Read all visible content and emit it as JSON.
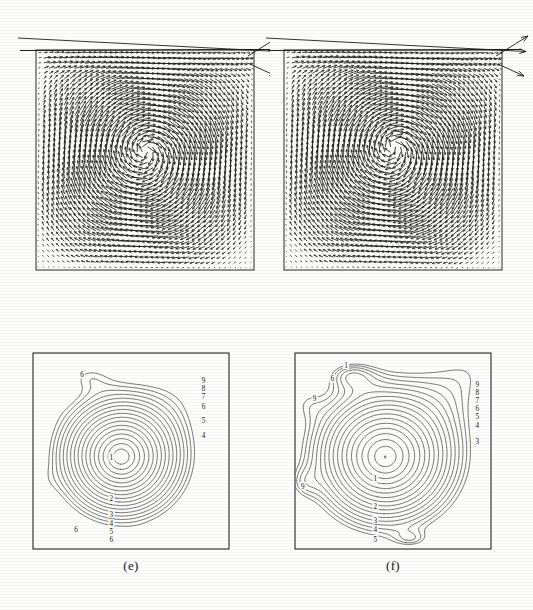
{
  "figure": {
    "type": "multi-panel scientific figure",
    "background_color": "#fdfdfc",
    "ink_color": "#1a1a1a",
    "panel_count": 4
  },
  "panels": [
    {
      "id": "vector-left",
      "kind": "vector-field",
      "caption": "",
      "box": {
        "x": 36,
        "y": 50,
        "width": 218,
        "height": 220
      },
      "description": "Velocity vector field in a square cavity; primary clockwise vortex centred slightly above mid-height; dense short vectors near all walls; long lid vectors overshoot the top-right corner.",
      "vortex_center": {
        "x": 0.49,
        "y": 0.44
      },
      "lid_arrow_count": 3
    },
    {
      "id": "vector-right",
      "kind": "vector-field",
      "caption": "",
      "box": {
        "x": 284,
        "y": 50,
        "width": 218,
        "height": 220
      },
      "description": "Velocity vector field in a square cavity; primary vortex larger and rounder than left panel; lid vectors overshoot the top-right corner.",
      "vortex_center": {
        "x": 0.47,
        "y": 0.45
      },
      "lid_arrow_count": 3
    },
    {
      "id": "contour-e",
      "kind": "contour",
      "caption": "(e)",
      "box": {
        "x": 33,
        "y": 353,
        "width": 196,
        "height": 196
      },
      "caption_pos": {
        "x": 131,
        "y": 566
      }
    },
    {
      "id": "contour-f",
      "kind": "contour",
      "caption": "(f)",
      "box": {
        "x": 295,
        "y": 353,
        "width": 196,
        "height": 196
      },
      "caption_pos": {
        "x": 393,
        "y": 566
      }
    }
  ],
  "chart_data": [
    {
      "type": "line",
      "id": "contour-e",
      "title": "(e)",
      "subtitle": "Streamfunction / temperature contours, coarse-grid solution",
      "xlabel": "",
      "ylabel": "",
      "xlim": [
        0,
        1
      ],
      "ylim": [
        0,
        1
      ],
      "grid": false,
      "legend": "none",
      "axes_frame": true,
      "contour_levels": [
        1,
        2,
        3,
        4,
        5,
        6,
        7,
        8,
        9
      ],
      "labels": [
        {
          "text": "1",
          "x": 0.4,
          "y": 0.47,
          "note": "innermost closed contour, core"
        },
        {
          "text": "2",
          "x": 0.4,
          "y": 0.26,
          "note": "below core"
        },
        {
          "text": "3",
          "x": 0.4,
          "y": 0.18,
          "note": "below core"
        },
        {
          "text": "4",
          "x": 0.4,
          "y": 0.13,
          "note": "below core"
        },
        {
          "text": "5",
          "x": 0.4,
          "y": 0.09,
          "note": "below core"
        },
        {
          "text": "6",
          "x": 0.4,
          "y": 0.05,
          "note": "near bottom wall"
        },
        {
          "text": "6",
          "x": 0.22,
          "y": 0.1,
          "note": "lower-left flank"
        },
        {
          "text": "6",
          "x": 0.25,
          "y": 0.89,
          "note": "upper-left closed cell"
        },
        {
          "text": "9",
          "x": 0.87,
          "y": 0.86,
          "note": "right wall stack, top"
        },
        {
          "text": "8",
          "x": 0.87,
          "y": 0.82,
          "note": "right wall stack"
        },
        {
          "text": "7",
          "x": 0.87,
          "y": 0.78,
          "note": "right wall stack"
        },
        {
          "text": "6",
          "x": 0.87,
          "y": 0.73,
          "note": "right wall stack"
        },
        {
          "text": "5",
          "x": 0.87,
          "y": 0.66,
          "note": "right wall stack"
        },
        {
          "text": "4",
          "x": 0.87,
          "y": 0.58,
          "note": "right wall stack, bottom"
        }
      ],
      "features": {
        "core": "single rounded polygonal closed contour near centre labelled 1",
        "upper_left_cell": "small nested closed-contour cell near top-left labelled 6",
        "upper_right": "dense fan of contours converging into the top-right corner",
        "lower_right": "small closed cell near bottom centre-right",
        "left_wall": "two shallow bulges along the left wall"
      }
    },
    {
      "type": "line",
      "id": "contour-f",
      "title": "(f)",
      "subtitle": "Streamfunction / temperature contours, fine-grid solution",
      "xlabel": "",
      "ylabel": "",
      "xlim": [
        0,
        1
      ],
      "ylim": [
        0,
        1
      ],
      "grid": false,
      "legend": "none",
      "axes_frame": true,
      "contour_levels": [
        1,
        2,
        3,
        4,
        5,
        6,
        7,
        8,
        9
      ],
      "labels": [
        {
          "text": "1",
          "x": 0.41,
          "y": 0.36,
          "note": "innermost closed contour, large core"
        },
        {
          "text": "2",
          "x": 0.41,
          "y": 0.22,
          "note": "below core"
        },
        {
          "text": "3",
          "x": 0.41,
          "y": 0.15,
          "note": "below core"
        },
        {
          "text": "4",
          "x": 0.41,
          "y": 0.1,
          "note": "below core"
        },
        {
          "text": "5",
          "x": 0.41,
          "y": 0.05,
          "note": "near bottom wall"
        },
        {
          "text": "1",
          "x": 0.26,
          "y": 0.94,
          "note": "upper-left closed cell core"
        },
        {
          "text": "6",
          "x": 0.19,
          "y": 0.87,
          "note": "upper-left cell flank"
        },
        {
          "text": "9",
          "x": 0.1,
          "y": 0.77,
          "note": "left wall closed cell"
        },
        {
          "text": "9",
          "x": 0.04,
          "y": 0.32,
          "note": "left wall lower cell"
        },
        {
          "text": "9",
          "x": 0.93,
          "y": 0.84,
          "note": "right wall stack, top"
        },
        {
          "text": "8",
          "x": 0.93,
          "y": 0.8,
          "note": "right wall stack"
        },
        {
          "text": "7",
          "x": 0.93,
          "y": 0.76,
          "note": "right wall stack"
        },
        {
          "text": "6",
          "x": 0.93,
          "y": 0.72,
          "note": "right wall stack"
        },
        {
          "text": "5",
          "x": 0.93,
          "y": 0.68,
          "note": "right wall stack"
        },
        {
          "text": "4",
          "x": 0.93,
          "y": 0.63,
          "note": "right wall stack"
        },
        {
          "text": "3",
          "x": 0.93,
          "y": 0.55,
          "note": "right wall stack, bottom"
        }
      ],
      "features": {
        "core": "large smooth closed oval contour near centre labelled 1",
        "upper_left_cell": "nested closed-contour cell near top-left labelled 1 and 6",
        "left_wall": "two small closed cells along the left wall labelled 9",
        "upper_right": "dense fan of contours converging into the top-right corner",
        "lower_right": "small closed cell near bottom centre-right"
      }
    }
  ]
}
